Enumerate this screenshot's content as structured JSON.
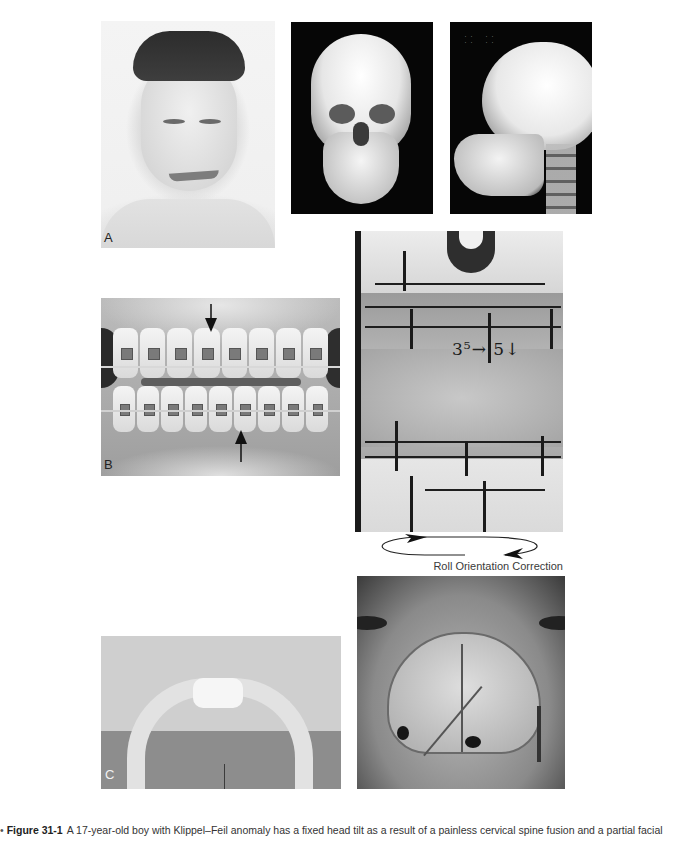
{
  "figure": {
    "number": "Figure 31-1",
    "caption": "A 17-year-old boy with Klippel–Feil anomaly has a fixed head tilt as a result of a painless cervical spine fusion and a partial facial",
    "bullet": "•"
  },
  "panels": {
    "A": {
      "label": "A",
      "description": "Frontal photograph of patient with head tilt and braces"
    },
    "xray_frontal": {
      "description": "3D CT frontal view of skull"
    },
    "xray_lateral": {
      "description": "3D CT lateral view of skull and cervical spine",
      "overlay_text": "· ·    · ·\n· ·    · ·"
    },
    "B": {
      "label": "B",
      "description": "Intraoral photograph of orthodontic braces with arrows marking midline"
    },
    "model": {
      "description": "Dental cast model on articulator with marked reference lines",
      "annotation": "3⁵→ 5↓"
    },
    "roll": {
      "label": "Roll Orientation Correction"
    },
    "C": {
      "label": "C",
      "description": "Bone specimen (mandibular/cranial segment)"
    },
    "skull_top": {
      "description": "Intraoperative view of cranium with osteotomy lines and fixation plate"
    }
  }
}
